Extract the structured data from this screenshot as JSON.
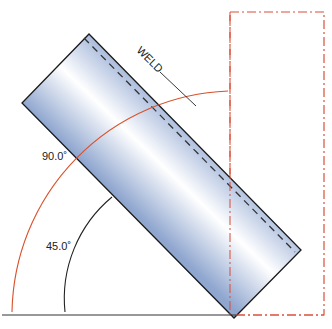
{
  "diagram": {
    "labels": {
      "weld": "WELD",
      "angle_large": "90.0˚",
      "angle_small": "45.0˚"
    },
    "colors": {
      "pipe_edge": "#1a1a1a",
      "pipe_fill_dark": "#8fa6cf",
      "pipe_fill_light": "#ffffff",
      "dimension_arc_red": "#d9502a",
      "phantom_red": "#d9503a",
      "dimension_arc_black": "#222222",
      "baseline": "#333333"
    },
    "angles": {
      "large_deg": 90.0,
      "small_deg": 45.0
    }
  }
}
